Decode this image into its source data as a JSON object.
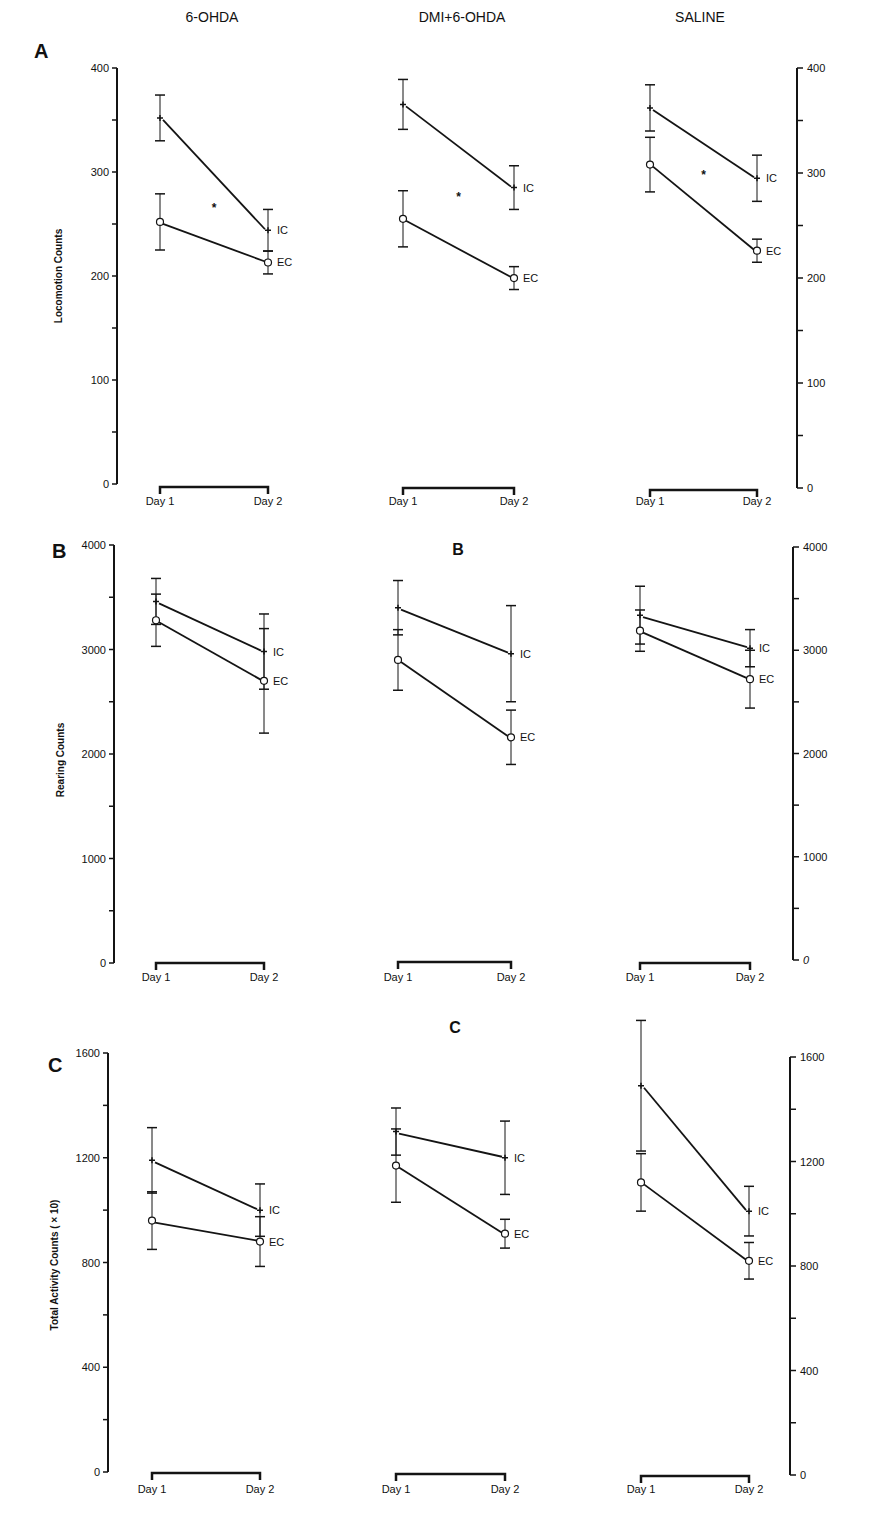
{
  "figure": {
    "column_titles": [
      "6-OHDA",
      "DMI+6-OHDA",
      "SALINE"
    ],
    "x_tick_labels": [
      "Day 1",
      "Day 2"
    ],
    "series_labels": {
      "ic": "IC",
      "ec": "EC"
    },
    "significance_marker": "*"
  },
  "chart_data": [
    {
      "type": "line",
      "panel": "A",
      "title": "Locomotion",
      "ylabel": "Locomotion Counts",
      "ylim": [
        0,
        400
      ],
      "yticks": [
        0,
        100,
        200,
        300,
        400
      ],
      "categories": [
        "Day 1",
        "Day 2"
      ],
      "groups": [
        {
          "name": "6-OHDA",
          "significant": true,
          "series": [
            {
              "name": "IC",
              "marker": "+",
              "values": [
                352,
                244
              ],
              "error": [
                22,
                20
              ]
            },
            {
              "name": "EC",
              "marker": "o",
              "values": [
                252,
                213
              ],
              "error": [
                27,
                11
              ]
            }
          ]
        },
        {
          "name": "DMI+6-OHDA",
          "significant": true,
          "series": [
            {
              "name": "IC",
              "marker": "+",
              "values": [
                365,
                285
              ],
              "error": [
                24,
                21
              ]
            },
            {
              "name": "EC",
              "marker": "o",
              "values": [
                255,
                198
              ],
              "error": [
                27,
                11
              ]
            }
          ]
        },
        {
          "name": "SALINE",
          "significant": true,
          "series": [
            {
              "name": "IC",
              "marker": "+",
              "values": [
                362,
                295
              ],
              "error": [
                22,
                22
              ]
            },
            {
              "name": "EC",
              "marker": "o",
              "values": [
                308,
                226
              ],
              "error": [
                26,
                11
              ]
            }
          ]
        }
      ]
    },
    {
      "type": "line",
      "panel": "B",
      "title": "Rearing",
      "ylabel": "Rearing Counts",
      "ylim": [
        0,
        4000
      ],
      "yticks": [
        0,
        1000,
        2000,
        3000,
        4000
      ],
      "categories": [
        "Day 1",
        "Day 2"
      ],
      "groups": [
        {
          "name": "6-OHDA",
          "significant": false,
          "series": [
            {
              "name": "IC",
              "marker": "+",
              "values": [
                3460,
                2980
              ],
              "error": [
                220,
                360
              ]
            },
            {
              "name": "EC",
              "marker": "o",
              "values": [
                3280,
                2700
              ],
              "error": [
                250,
                500
              ]
            }
          ]
        },
        {
          "name": "DMI+6-OHDA",
          "significant": false,
          "series": [
            {
              "name": "IC",
              "marker": "+",
              "values": [
                3400,
                2960
              ],
              "error": [
                260,
                460
              ]
            },
            {
              "name": "EC",
              "marker": "o",
              "values": [
                2900,
                2160
              ],
              "error": [
                290,
                260
              ]
            }
          ]
        },
        {
          "name": "SALINE",
          "significant": false,
          "series": [
            {
              "name": "IC",
              "marker": "+",
              "values": [
                3340,
                3020
              ],
              "error": [
                280,
                180
              ]
            },
            {
              "name": "EC",
              "marker": "o",
              "values": [
                3190,
                2720
              ],
              "error": [
                200,
                280
              ]
            }
          ]
        }
      ]
    },
    {
      "type": "line",
      "panel": "C",
      "title": "Total Activity",
      "ylabel": "Total Activity Counts ( × 10)",
      "ylim": [
        0,
        1600
      ],
      "yticks": [
        0,
        400,
        800,
        1200,
        1600
      ],
      "categories": [
        "Day 1",
        "Day 2"
      ],
      "groups": [
        {
          "name": "6-OHDA",
          "significant": false,
          "series": [
            {
              "name": "IC",
              "marker": "+",
              "values": [
                1190,
                1000
              ],
              "error": [
                125,
                100
              ]
            },
            {
              "name": "EC",
              "marker": "o",
              "values": [
                960,
                880
              ],
              "error": [
                110,
                95
              ]
            }
          ]
        },
        {
          "name": "DMI+6-OHDA",
          "significant": false,
          "series": [
            {
              "name": "IC",
              "marker": "+",
              "values": [
                1300,
                1200
              ],
              "error": [
                90,
                140
              ]
            },
            {
              "name": "EC",
              "marker": "o",
              "values": [
                1170,
                910
              ],
              "error": [
                140,
                55
              ]
            }
          ]
        },
        {
          "name": "SALINE",
          "significant": false,
          "series": [
            {
              "name": "IC",
              "marker": "+",
              "values": [
                1490,
                1010
              ],
              "error": [
                250,
                95
              ]
            },
            {
              "name": "EC",
              "marker": "o",
              "values": [
                1120,
                820
              ],
              "error": [
                110,
                70
              ]
            }
          ]
        }
      ]
    }
  ],
  "panels": {
    "A": {
      "letter": "A",
      "ylabel": "Locomotion Counts",
      "left_ticks": [
        "0",
        "100",
        "200",
        "300",
        "400"
      ],
      "right_ticks": [
        "0",
        "100",
        "200",
        "300",
        "400"
      ]
    },
    "B": {
      "letter": "B",
      "mid_letter": "B",
      "ylabel": "Rearing Counts",
      "left_ticks": [
        "0",
        "1000",
        "2000",
        "3000",
        "4000"
      ],
      "right_ticks": [
        "0",
        "1000",
        "2000",
        "3000",
        "4000"
      ]
    },
    "C": {
      "letter": "C",
      "mid_letter": "C",
      "ylabel": "Total Activity Counts ( × 10)",
      "left_ticks": [
        "0",
        "400",
        "800",
        "1200",
        "1600"
      ],
      "right_ticks": [
        "0",
        "400",
        "800",
        "1200",
        "1600"
      ]
    }
  }
}
